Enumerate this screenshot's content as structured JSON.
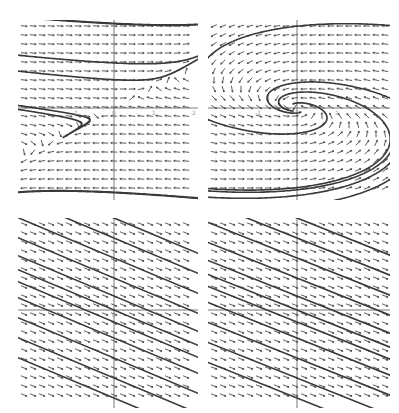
{
  "figure": {
    "background": "#ffffff",
    "ink_color": "#3a3a3a",
    "arrow_color": "#4a4a4a",
    "axis_color": "#555555",
    "panels": [
      {
        "id": "top-left",
        "kind": "saddle",
        "description": "Direction field with saddle-like trajectories through origin",
        "box": {
          "x": 18,
          "y": 20,
          "w": 180,
          "h": 180
        },
        "origin": {
          "x": 96,
          "y": 88
        },
        "tick_labels": {
          "x": [
            "-1",
            "0",
            "1",
            "2"
          ]
        },
        "field": {
          "a": -1.0,
          "b": 2.0,
          "c": 0.15,
          "d": -0.1
        }
      },
      {
        "id": "top-right",
        "kind": "spiral",
        "description": "Direction field with spiral sink at origin",
        "box": {
          "x": 208,
          "y": 20,
          "w": 182,
          "h": 180
        },
        "origin": {
          "x": 89,
          "y": 88
        },
        "tick_labels": {
          "x": [
            "-1",
            "0",
            "1"
          ]
        },
        "field": {
          "a": -0.6,
          "b": -1.8,
          "c": 0.35,
          "d": -0.2
        }
      },
      {
        "id": "bottom-left",
        "kind": "parallel",
        "description": "Direction field with parallel straight-line solutions",
        "box": {
          "x": 18,
          "y": 218,
          "w": 180,
          "h": 190
        },
        "origin": {
          "x": 96,
          "y": 92
        },
        "tick_labels": {
          "x": [
            "0"
          ]
        },
        "field": {
          "slope": -0.42
        }
      },
      {
        "id": "bottom-right",
        "kind": "parallel-degenerate",
        "description": "Direction field with near-parallel solutions and degenerate node",
        "box": {
          "x": 208,
          "y": 218,
          "w": 182,
          "h": 190
        },
        "origin": {
          "x": 89,
          "y": 92
        },
        "tick_labels": {
          "x": [
            "0"
          ]
        },
        "field": {
          "slope": -0.4
        }
      }
    ]
  }
}
